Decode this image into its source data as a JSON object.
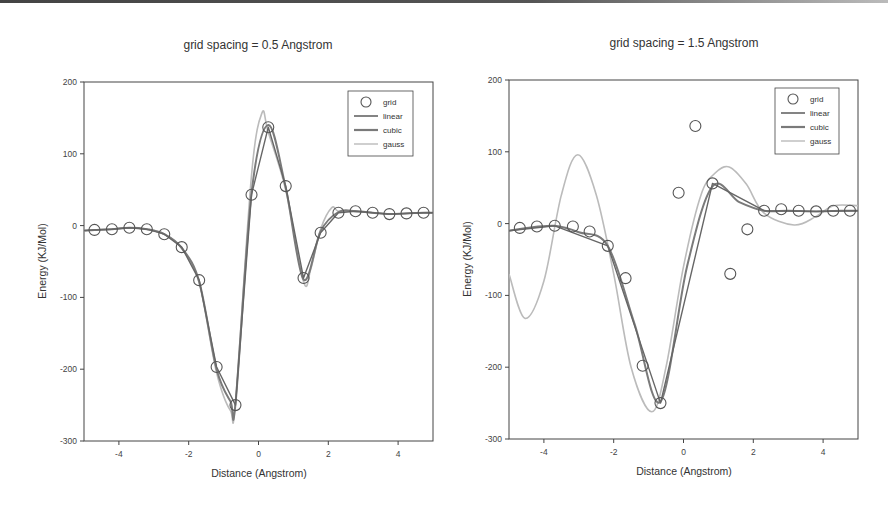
{
  "chart_data": [
    {
      "type": "line",
      "title": "grid spacing = 0.5 Angstrom",
      "xlabel": "Distance (Angstrom)",
      "ylabel": "Energy (KJ/Mol)",
      "xlim": [
        -5,
        5
      ],
      "ylim": [
        -300,
        200
      ],
      "xticks": [
        -4,
        -2,
        0,
        2,
        4
      ],
      "xtick_labels": [
        "-4",
        "-2",
        "0",
        "2",
        "4"
      ],
      "yticks": [
        200,
        100,
        0,
        -100,
        -200,
        -300
      ],
      "ytick_labels": [
        "200",
        "100",
        "0",
        "-100",
        "-200",
        "-300"
      ],
      "grid": false,
      "legend": {
        "position": "upper right",
        "entries": [
          "grid",
          "linear",
          "cubic",
          "gauss"
        ]
      },
      "series": [
        {
          "name": "grid",
          "style": "open-circle",
          "color": "#555555",
          "x": [
            -4.7,
            -4.2,
            -3.7,
            -3.2,
            -2.7,
            -2.2,
            -1.7,
            -1.2,
            -0.66,
            -0.2,
            0.28,
            0.78,
            1.29,
            1.78,
            2.29,
            2.78,
            3.27,
            3.75,
            4.24,
            4.73
          ],
          "y": [
            -6,
            -5,
            -3,
            -5,
            -12,
            -30,
            -76,
            -197,
            -250,
            43,
            137,
            55,
            -73,
            -10,
            18,
            20,
            18,
            16,
            17,
            18
          ]
        },
        {
          "name": "linear",
          "style": "line",
          "color": "#666666",
          "x": [
            -5,
            -4.7,
            -4.2,
            -3.7,
            -3.2,
            -2.7,
            -2.2,
            -1.7,
            -1.2,
            -0.66,
            -0.2,
            0.28,
            0.78,
            1.29,
            1.78,
            2.29,
            2.78,
            3.27,
            3.75,
            4.24,
            4.73,
            5
          ],
          "y": [
            -7,
            -6,
            -5,
            -3,
            -5,
            -12,
            -30,
            -76,
            -197,
            -250,
            43,
            137,
            55,
            -73,
            -10,
            18,
            20,
            18,
            16,
            17,
            18,
            18
          ]
        },
        {
          "name": "cubic",
          "style": "line",
          "color": "#7a7a7a",
          "x": [
            -5,
            -4.7,
            -4.2,
            -3.7,
            -3.2,
            -2.7,
            -2.2,
            -1.7,
            -1.2,
            -0.8,
            -0.66,
            -0.2,
            0.28,
            0.78,
            1.29,
            1.78,
            2.29,
            2.78,
            3.27,
            3.75,
            4.24,
            4.73,
            5
          ],
          "y": [
            -7,
            -6,
            -5,
            -3,
            -5,
            -12,
            -31,
            -78,
            -200,
            -245,
            -248,
            45,
            140,
            53,
            -75,
            -8,
            19,
            20,
            18,
            16,
            17,
            18,
            18
          ]
        },
        {
          "name": "gauss",
          "style": "line",
          "color": "#bbbbbb",
          "x": [
            -5,
            -4.7,
            -4.2,
            -3.7,
            -3.2,
            -2.7,
            -2.2,
            -1.7,
            -1.2,
            -0.8,
            -0.66,
            -0.2,
            0.1,
            0.28,
            0.78,
            1.29,
            1.5,
            1.78,
            2.1,
            2.29,
            2.78,
            3.27,
            3.75,
            4.24,
            4.73,
            5
          ],
          "y": [
            -7,
            -6,
            -5,
            -3,
            -5,
            -12,
            -32,
            -80,
            -205,
            -258,
            -245,
            70,
            157,
            130,
            50,
            -78,
            -60,
            -5,
            25,
            20,
            20,
            18,
            16,
            17,
            18,
            18
          ]
        }
      ]
    },
    {
      "type": "line",
      "title": "grid spacing = 1.5 Angstrom",
      "xlabel": "Distance (Angstrom)",
      "ylabel": "Energy (KJ/Mol)",
      "xlim": [
        -5,
        5
      ],
      "ylim": [
        -300,
        200
      ],
      "xticks": [
        -4,
        -2,
        0,
        2,
        4
      ],
      "xtick_labels": [
        "-4",
        "-2",
        "0",
        "2",
        "4"
      ],
      "yticks": [
        200,
        100,
        0,
        -100,
        -200,
        -300
      ],
      "ytick_labels": [
        "200",
        "100",
        "0",
        "-100",
        "-200",
        "-300"
      ],
      "grid": false,
      "legend": {
        "position": "upper right",
        "entries": [
          "grid",
          "linear",
          "cubic",
          "gauss"
        ]
      },
      "series": [
        {
          "name": "grid",
          "style": "open-circle",
          "color": "#555555",
          "x": [
            -4.69,
            -4.2,
            -3.69,
            -3.17,
            -2.69,
            -2.17,
            -1.66,
            -1.17,
            -0.66,
            -0.14,
            0.34,
            0.83,
            1.34,
            1.83,
            2.31,
            2.8,
            3.3,
            3.8,
            4.29,
            4.77
          ],
          "y": [
            -6,
            -4,
            -3,
            -4,
            -11,
            -31,
            -76,
            -198,
            -250,
            43,
            136,
            56,
            -70,
            -8,
            18,
            20,
            18,
            17,
            18,
            18
          ]
        },
        {
          "name": "linear",
          "style": "line",
          "color": "#666666",
          "x": [
            -5,
            -3.69,
            -2.17,
            -0.66,
            0.83,
            2.31,
            3.8,
            5
          ],
          "y": [
            -10,
            -3,
            -31,
            -250,
            56,
            18,
            17,
            18
          ]
        },
        {
          "name": "cubic",
          "style": "line",
          "color": "#7a7a7a",
          "x": [
            -5,
            -4.5,
            -3.69,
            -3.0,
            -2.17,
            -1.4,
            -0.66,
            0.1,
            0.83,
            1.6,
            2.31,
            3.0,
            3.8,
            4.5,
            5
          ],
          "y": [
            -10,
            -6,
            -3,
            -12,
            -31,
            -140,
            -248,
            -60,
            52,
            30,
            18,
            18,
            17,
            18,
            18
          ]
        },
        {
          "name": "gauss",
          "style": "line",
          "color": "#bbbbbb",
          "x": [
            -5,
            -4.54,
            -4.0,
            -3.5,
            -3.03,
            -2.5,
            -2.0,
            -1.5,
            -0.91,
            -0.5,
            0.0,
            0.5,
            0.9,
            1.31,
            1.8,
            2.3,
            3.17,
            3.8,
            4.3,
            5
          ],
          "y": [
            -70,
            -132,
            -80,
            40,
            96,
            40,
            -70,
            -200,
            -262,
            -200,
            -60,
            40,
            70,
            79,
            55,
            15,
            -2,
            10,
            25,
            25
          ]
        }
      ]
    }
  ]
}
